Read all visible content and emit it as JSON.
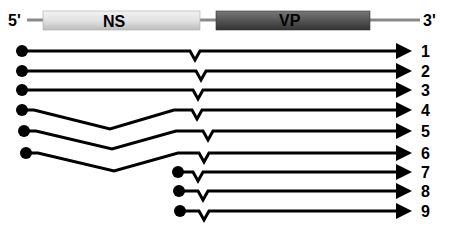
{
  "genome": {
    "five_prime_label": "5'",
    "three_prime_label": "3'",
    "ns_label": "NS",
    "vp_label": "VP",
    "colors": {
      "backbone": "#8a8a8a",
      "ns_fill": "#dcdcdc",
      "vp_fill": "#555555",
      "line": "#000000"
    }
  },
  "transcripts": [
    {
      "label": "1",
      "y": 51,
      "start_x": 22,
      "splice_dip": false,
      "notch_x": 195
    },
    {
      "label": "2",
      "y": 71,
      "start_x": 22,
      "splice_dip": false,
      "notch_x": 201
    },
    {
      "label": "3",
      "y": 90,
      "start_x": 22,
      "splice_dip": false,
      "notch_x": 198
    },
    {
      "label": "4",
      "y": 110,
      "start_x": 22,
      "splice_dip": true,
      "dip_y": 129,
      "notch_x": 197
    },
    {
      "label": "5",
      "y": 131,
      "start_x": 24,
      "splice_dip": true,
      "dip_y": 149,
      "notch_x": 208
    },
    {
      "label": "6",
      "y": 153,
      "start_x": 26,
      "splice_dip": true,
      "dip_y": 171,
      "notch_x": 204
    },
    {
      "label": "7",
      "y": 172,
      "start_x": 178,
      "splice_dip": false,
      "notch_x": 198
    },
    {
      "label": "8",
      "y": 191,
      "start_x": 179,
      "splice_dip": false,
      "notch_x": 203
    },
    {
      "label": "9",
      "y": 211,
      "start_x": 180,
      "splice_dip": false,
      "notch_x": 204
    }
  ]
}
